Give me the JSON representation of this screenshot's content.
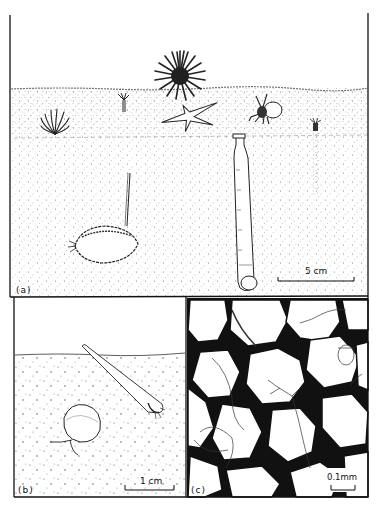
{
  "figure": {
    "panels": [
      {
        "id": "a",
        "label": "(a)",
        "scale_bar": "5 cm",
        "description": "Sandy seabed cross-section with sea urchin, starfish, hermit crab, anemones, tube worm, and burrowing bivalve with siphon"
      },
      {
        "id": "b",
        "label": "(b)",
        "scale_bar": "1 cm",
        "description": "Close-up of sediment with tusk shell and small bivalve"
      },
      {
        "id": "c",
        "label": "(c)",
        "scale_bar": "0.1mm",
        "description": "Interstitial meiofauna between sand grains"
      }
    ],
    "colors": {
      "ink": "#111111",
      "paper": "#ffffff",
      "sediment_dot": "#555555"
    }
  }
}
